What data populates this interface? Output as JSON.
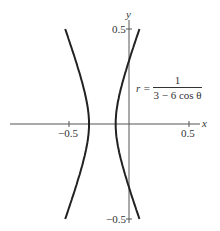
{
  "chart_data": {
    "type": "line",
    "title": "",
    "xlabel": "x",
    "ylabel": "y",
    "xlim": [
      -1.0,
      0.75
    ],
    "ylim": [
      -0.55,
      0.55
    ],
    "xticks": [
      -0.5,
      0.5
    ],
    "yticks": [
      0.5,
      -0.5
    ],
    "xtick_labels": [
      "−0.5",
      "0.5"
    ],
    "ytick_labels": [
      "0.5",
      "−0.5"
    ],
    "grid": false,
    "legend": null,
    "annotation": {
      "lhs": "r =",
      "numerator": "1",
      "denominator": "3 − 6 cos θ"
    },
    "series": [
      {
        "name": "r = 1/(3 - 6 cos theta)",
        "kind": "polar hyperbola",
        "equation": "r = 1/(3 - 6cosθ)",
        "vertices_x": [
          -0.3333,
          -0.1111
        ],
        "center_x": -0.2222,
        "a": 0.1111,
        "b": 0.1925,
        "eccentricity": 2
      }
    ]
  },
  "labels": {
    "x_axis": "x",
    "y_axis": "y",
    "x_neg": "−0.5",
    "x_pos": "0.5",
    "y_pos": "0.5",
    "y_neg": "−0.5",
    "eq_lhs": "r =",
    "eq_num": "1",
    "eq_den": "3 − 6 cos θ"
  }
}
